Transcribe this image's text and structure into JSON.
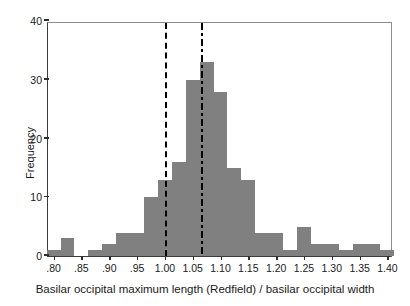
{
  "chart_data": {
    "type": "bar",
    "title": "",
    "subtitle": "",
    "xlabel": "Basilar occipital maximum length (Redfield) / basilar occipital width",
    "ylabel": "Frequency",
    "xlim": [
      0.79,
      1.41
    ],
    "ylim": [
      0,
      40
    ],
    "grid": false,
    "legend": "none",
    "bin_width": 0.025,
    "xticks": [
      {
        "value": 0.8,
        "label": ".80"
      },
      {
        "value": 0.85,
        "label": ".85"
      },
      {
        "value": 0.9,
        "label": ".90"
      },
      {
        "value": 0.95,
        "label": ".95"
      },
      {
        "value": 1.0,
        "label": "1.00"
      },
      {
        "value": 1.05,
        "label": "1.05"
      },
      {
        "value": 1.1,
        "label": "1.10"
      },
      {
        "value": 1.15,
        "label": "1.15"
      },
      {
        "value": 1.2,
        "label": "1.20"
      },
      {
        "value": 1.25,
        "label": "1.25"
      },
      {
        "value": 1.3,
        "label": "1.30"
      },
      {
        "value": 1.35,
        "label": "1.35"
      },
      {
        "value": 1.4,
        "label": "1.40"
      }
    ],
    "yticks": [
      {
        "value": 0,
        "label": "0"
      },
      {
        "value": 10,
        "label": "10"
      },
      {
        "value": 20,
        "label": "20"
      },
      {
        "value": 30,
        "label": "30"
      },
      {
        "value": 40,
        "label": "40"
      }
    ],
    "bin_starts": [
      0.7875,
      0.8125,
      0.8375,
      0.8625,
      0.8875,
      0.9125,
      0.9375,
      0.9625,
      0.9875,
      1.0125,
      1.0375,
      1.0625,
      1.0875,
      1.1125,
      1.1375,
      1.1625,
      1.1875,
      1.2125,
      1.2375,
      1.2625,
      1.2875,
      1.3125,
      1.3375,
      1.3625,
      1.3875
    ],
    "values": [
      1,
      3,
      0,
      1,
      2,
      4,
      4,
      10,
      13,
      16,
      30,
      33,
      28,
      15,
      13,
      4,
      4,
      1,
      5,
      2,
      2,
      1,
      2,
      2,
      1
    ],
    "bar_color": "#808080",
    "reference_lines": [
      {
        "name": "reference-line-dashed",
        "value": 1.0,
        "style": "dashed",
        "color": "#000000"
      },
      {
        "name": "reference-line-dashdot",
        "value": 1.065,
        "style": "dash-dot",
        "color": "#000000"
      }
    ]
  }
}
